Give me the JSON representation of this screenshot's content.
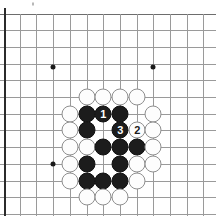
{
  "board": {
    "kind": "go-board-diagram",
    "description": "Go (Weiqi/Baduk) board problem diagram showing a black group surrounded by white stones, with numbered move sequence 1, 2, 3",
    "geometry": {
      "image_width": 216,
      "image_height": 216,
      "grid_spacing": 16.7,
      "origin_x": 4,
      "origin_y": 14,
      "columns": 13,
      "rows": 12,
      "stone_diameter": 17
    },
    "colors": {
      "background": "#ffffff",
      "grid_line": "#9a9a9a",
      "board_edge": "#2b2b2b",
      "black_stone": "#1c1c1c",
      "white_stone": "#fdfdfd",
      "white_stone_border": "#8f8f8f",
      "star_point": "#1a1a1a",
      "black_label_text": "#ffffff",
      "white_label_text": "#1a1a1a"
    },
    "star_points": [
      {
        "name": "star-point-upper-left",
        "x": 53,
        "y": 67
      },
      {
        "name": "star-point-upper-right",
        "x": 153,
        "y": 67
      },
      {
        "name": "star-point-lower-left",
        "x": 53,
        "y": 164
      }
    ],
    "h_lines_y": [
      14,
      30,
      47,
      64,
      80,
      97,
      114,
      130,
      147,
      164,
      181,
      197,
      214
    ],
    "v_lines_x": [
      4,
      20,
      36,
      53,
      70,
      87,
      103,
      120,
      137,
      153,
      170,
      187,
      203
    ],
    "edge_left_x": 4,
    "stones": [
      {
        "id": "w-1",
        "color": "white",
        "x": 87,
        "y": 97,
        "label": ""
      },
      {
        "id": "w-2",
        "color": "white",
        "x": 103,
        "y": 97,
        "label": ""
      },
      {
        "id": "w-3",
        "color": "white",
        "x": 120,
        "y": 97,
        "label": ""
      },
      {
        "id": "w-4",
        "color": "white",
        "x": 137,
        "y": 97,
        "label": ""
      },
      {
        "id": "w-5",
        "color": "white",
        "x": 70,
        "y": 114,
        "label": ""
      },
      {
        "id": "b-1",
        "color": "black",
        "x": 87,
        "y": 114,
        "label": ""
      },
      {
        "id": "b-move-1",
        "color": "black",
        "x": 103,
        "y": 114,
        "label": "1"
      },
      {
        "id": "b-2",
        "color": "black",
        "x": 120,
        "y": 114,
        "label": ""
      },
      {
        "id": "w-6",
        "color": "white",
        "x": 153,
        "y": 114,
        "label": ""
      },
      {
        "id": "w-7",
        "color": "white",
        "x": 70,
        "y": 130,
        "label": ""
      },
      {
        "id": "b-3",
        "color": "black",
        "x": 87,
        "y": 130,
        "label": ""
      },
      {
        "id": "b-move-3",
        "color": "black",
        "x": 120,
        "y": 130,
        "label": "3"
      },
      {
        "id": "w-move-2",
        "color": "white",
        "x": 137,
        "y": 130,
        "label": "2"
      },
      {
        "id": "w-8",
        "color": "white",
        "x": 153,
        "y": 130,
        "label": ""
      },
      {
        "id": "w-9",
        "color": "white",
        "x": 70,
        "y": 147,
        "label": ""
      },
      {
        "id": "w-10",
        "color": "white",
        "x": 87,
        "y": 147,
        "label": ""
      },
      {
        "id": "b-4",
        "color": "black",
        "x": 103,
        "y": 147,
        "label": ""
      },
      {
        "id": "b-5",
        "color": "black",
        "x": 120,
        "y": 147,
        "label": ""
      },
      {
        "id": "b-6",
        "color": "black",
        "x": 137,
        "y": 147,
        "label": ""
      },
      {
        "id": "w-11",
        "color": "white",
        "x": 153,
        "y": 147,
        "label": ""
      },
      {
        "id": "w-12",
        "color": "white",
        "x": 70,
        "y": 164,
        "label": ""
      },
      {
        "id": "b-7",
        "color": "black",
        "x": 87,
        "y": 164,
        "label": ""
      },
      {
        "id": "b-8",
        "color": "black",
        "x": 120,
        "y": 164,
        "label": ""
      },
      {
        "id": "w-13",
        "color": "white",
        "x": 137,
        "y": 164,
        "label": ""
      },
      {
        "id": "w-14",
        "color": "white",
        "x": 153,
        "y": 164,
        "label": ""
      },
      {
        "id": "w-15",
        "color": "white",
        "x": 70,
        "y": 181,
        "label": ""
      },
      {
        "id": "b-9",
        "color": "black",
        "x": 87,
        "y": 181,
        "label": ""
      },
      {
        "id": "b-10",
        "color": "black",
        "x": 103,
        "y": 181,
        "label": ""
      },
      {
        "id": "b-11",
        "color": "black",
        "x": 120,
        "y": 181,
        "label": ""
      },
      {
        "id": "w-16",
        "color": "white",
        "x": 137,
        "y": 181,
        "label": ""
      },
      {
        "id": "w-17",
        "color": "white",
        "x": 87,
        "y": 197,
        "label": ""
      },
      {
        "id": "w-18",
        "color": "white",
        "x": 103,
        "y": 197,
        "label": ""
      },
      {
        "id": "w-19",
        "color": "white",
        "x": 120,
        "y": 197,
        "label": ""
      }
    ],
    "move_labels": [
      "1",
      "2",
      "3"
    ],
    "artifacts": [
      {
        "name": "scan-speck",
        "x": 33,
        "y": 4
      }
    ]
  }
}
